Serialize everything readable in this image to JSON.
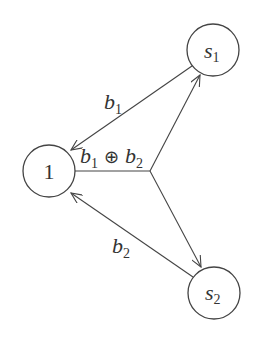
{
  "nodes": {
    "node1": {
      "label": "1"
    },
    "s1": {
      "label": "s",
      "sub": "1"
    },
    "s2": {
      "label": "s",
      "sub": "2"
    }
  },
  "edges": {
    "s1_to_1": {
      "label": "b",
      "sub": "1"
    },
    "s2_to_1": {
      "label": "b",
      "sub": "2"
    },
    "broadcast": {
      "left": "b",
      "left_sub": "1",
      "op": "⊕",
      "right": "b",
      "right_sub": "2"
    }
  },
  "colors": {
    "stroke": "#444444",
    "text": "#333333",
    "background": "#ffffff"
  }
}
